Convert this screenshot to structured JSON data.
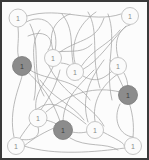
{
  "figure": {
    "kind": "node-link-graph-drawing",
    "background_color": "#fcfcfc",
    "border_color": "#3a3a3a",
    "border_width_px": 2,
    "width_px": 149,
    "height_px": 160,
    "edge_color": "#a8a8a8",
    "edge_width_px": 0.8,
    "node_light_fill": "#fbfbfb",
    "node_light_stroke": "#b8b8b8",
    "node_dark_fill": "#8c8c8c",
    "node_dark_stroke": "#7a7a7a",
    "node_label_color": "#8a8a8a",
    "node_label_dark_color": "#3c3c3c",
    "node_radius_px": 9,
    "title": "",
    "caption": ""
  },
  "nodes": [
    {
      "id": "n1",
      "label": "1",
      "cx": 18,
      "cy": 18,
      "r": 9,
      "style": "light"
    },
    {
      "id": "n2",
      "label": "1",
      "cx": 130,
      "cy": 16,
      "r": 8.5,
      "style": "light"
    },
    {
      "id": "n3",
      "label": "1",
      "cx": 22,
      "cy": 66,
      "r": 9.5,
      "style": "dark"
    },
    {
      "id": "n4",
      "label": "1",
      "cx": 53,
      "cy": 58,
      "r": 8.5,
      "style": "light"
    },
    {
      "id": "n5",
      "label": "1",
      "cx": 75,
      "cy": 72,
      "r": 8.5,
      "style": "light"
    },
    {
      "id": "n6",
      "label": "1",
      "cx": 118,
      "cy": 66,
      "r": 8.5,
      "style": "light"
    },
    {
      "id": "n7",
      "label": "1",
      "cx": 128,
      "cy": 95,
      "r": 9.5,
      "style": "dark"
    },
    {
      "id": "n8",
      "label": "1",
      "cx": 38,
      "cy": 118,
      "r": 9,
      "style": "light"
    },
    {
      "id": "n9",
      "label": "1",
      "cx": 63,
      "cy": 130,
      "r": 9.5,
      "style": "dark"
    },
    {
      "id": "n10",
      "label": "1",
      "cx": 95,
      "cy": 130,
      "r": 8.5,
      "style": "light"
    },
    {
      "id": "n11",
      "label": "1",
      "cx": 16,
      "cy": 146,
      "r": 8.5,
      "style": "light"
    },
    {
      "id": "n12",
      "label": "1",
      "cx": 133,
      "cy": 146,
      "r": 8.5,
      "style": "light"
    }
  ],
  "edges": [
    {
      "d": "M 18 27 C 20 45, 14 52, 22 66"
    },
    {
      "d": "M 22 66 C 34 80, 50 88, 63 130"
    },
    {
      "d": "M 26 22 C 50 10, 62 34, 53 58"
    },
    {
      "d": "M 27 16 C 60 6, 92 24, 121 14"
    },
    {
      "d": "M 53 50 C 48 34, 54 20, 70 14"
    },
    {
      "d": "M 60 52 C 80 38, 96 42, 104 18"
    },
    {
      "d": "M 53 67 C 44 86, 30 96, 38 118"
    },
    {
      "d": "M 61 63 C 70 64, 72 66, 75 72"
    },
    {
      "d": "M 75 63 C 70 44, 78 24, 96 12"
    },
    {
      "d": "M 82 70 C 100 60, 108 44, 126 26"
    },
    {
      "d": "M 83 76 C 100 86, 108 74, 118 66"
    },
    {
      "d": "M 118 57 C 112 36, 124 26, 130 25"
    },
    {
      "d": "M 124 73 C 128 80, 128 86, 128 95"
    },
    {
      "d": "M 120 104 C 112 120, 120 136, 133 137"
    },
    {
      "d": "M 120 92 C 96 86, 70 92, 46 112"
    },
    {
      "d": "M 38 127 C 42 140, 26 142, 16 138"
    },
    {
      "d": "M 46 120 C 60 124, 58 126, 63 130"
    },
    {
      "d": "M 72 132 C 82 134, 86 132, 95 130"
    },
    {
      "d": "M 63 121 C 64 100, 76 88, 94 70"
    },
    {
      "d": "M 95 121 C 92 104, 100 86, 118 74"
    },
    {
      "d": "M 103 132 C 118 140, 126 144, 124 146"
    },
    {
      "d": "M 24 146 C 54 156, 96 152, 125 148"
    },
    {
      "d": "M 20 138 C 34 116, 52 102, 60 70"
    },
    {
      "d": "M 14 137 C 8 110, 20 86, 22 76"
    },
    {
      "d": "M 133 137 C 136 110, 124 88, 110 60"
    },
    {
      "d": "M 30 24 C 42 48, 30 70, 44 96"
    },
    {
      "d": "M 62 14 C 78 34, 66 52, 78 80"
    },
    {
      "d": "M 88 12 C 100 32, 90 56, 100 88"
    },
    {
      "d": "M 108 14 C 118 40, 104 66, 112 100"
    },
    {
      "d": "M 40 30 C 26 48, 40 72, 34 100"
    },
    {
      "d": "M 120 30 C 104 50, 88 48, 74 80"
    },
    {
      "d": "M 30 70 C 48 82, 74 76, 90 100"
    },
    {
      "d": "M 48 64 C 62 96, 92 104, 104 126"
    },
    {
      "d": "M 84 120 C 72 104, 52 98, 40 80"
    },
    {
      "d": "M 46 54 C 66 48, 80 56, 92 44"
    },
    {
      "d": "M 28 36 C 46 28, 56 40, 48 50"
    },
    {
      "d": "M 104 60 C 92 76, 80 96, 88 122"
    },
    {
      "d": "M 36 110 C 52 96, 68 110, 86 124"
    },
    {
      "d": "M 70 138 C 86 148, 106 142, 118 150"
    },
    {
      "d": "M 54 128 C 40 134, 28 142, 22 148"
    }
  ]
}
